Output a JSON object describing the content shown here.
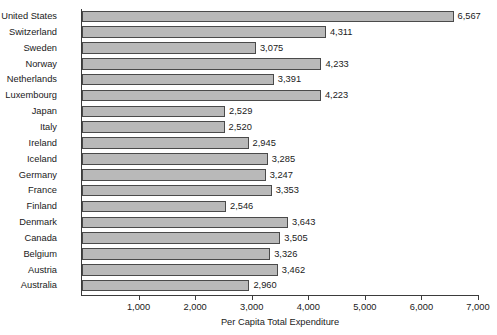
{
  "chart_data": {
    "type": "bar",
    "orientation": "horizontal",
    "title": "",
    "xlabel": "Per Capita Total Expenditure",
    "ylabel": "",
    "xlim": [
      0,
      7000
    ],
    "xticks": [
      0,
      1000,
      2000,
      3000,
      4000,
      5000,
      6000,
      7000
    ],
    "xtick_labels": [
      "",
      "1,000",
      "2,000",
      "3,000",
      "4,000",
      "5,000",
      "6,000",
      "7,000"
    ],
    "grid": false,
    "legend": null,
    "bar_color": "#b9b9b9",
    "bar_edge_color": "#4a4a4a",
    "axis_color": "#3b3b3b",
    "categories": [
      "United States",
      "Switzerland",
      "Sweden",
      "Norway",
      "Netherlands",
      "Luxembourg",
      "Japan",
      "Italy",
      "Ireland",
      "Iceland",
      "Germany",
      "France",
      "Finland",
      "Denmark",
      "Canada",
      "Belgium",
      "Austria",
      "Australia"
    ],
    "values": [
      6567,
      4311,
      3075,
      4233,
      3391,
      4223,
      2529,
      2520,
      2945,
      3285,
      3247,
      3353,
      2546,
      3643,
      3505,
      3326,
      3462,
      2960
    ],
    "value_labels": [
      "6,567",
      "4,311",
      "3,075",
      "4,233",
      "3,391",
      "4,223",
      "2,529",
      "2,520",
      "2,945",
      "3,285",
      "3,247",
      "3,353",
      "2,546",
      "3,643",
      "3,505",
      "3,326",
      "3,462",
      "2,960"
    ]
  }
}
